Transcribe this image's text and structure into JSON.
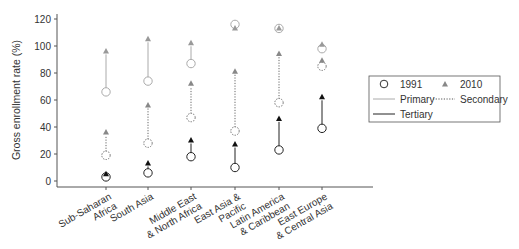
{
  "chart_data": {
    "type": "scatter",
    "title": "",
    "xlabel": "",
    "ylabel": "Gross enrollment rate (%)",
    "ylim": [
      0,
      120
    ],
    "yticks": [
      0,
      20,
      40,
      60,
      80,
      100,
      120
    ],
    "grid": false,
    "legend_position": "right",
    "categories": [
      [
        "Sub-Saharan",
        "Africa"
      ],
      [
        "South Asia"
      ],
      [
        "Middle East",
        "& North Africa"
      ],
      [
        "East Asia &",
        "Pacific"
      ],
      [
        "Latin America",
        "& Caribbean"
      ],
      [
        "East Europe",
        "& Central Asia"
      ]
    ],
    "series": [
      {
        "name": "Primary",
        "style": "solid-light",
        "color": "#aaaaaa",
        "values_1991": [
          66,
          74,
          87,
          116,
          113,
          98
        ],
        "values_2010": [
          96,
          105,
          102,
          113,
          113,
          101
        ]
      },
      {
        "name": "Secondary",
        "style": "dotted",
        "color": "#666666",
        "values_1991": [
          19,
          28,
          47,
          37,
          58,
          85
        ],
        "values_2010": [
          36,
          56,
          72,
          81,
          94,
          89
        ]
      },
      {
        "name": "Tertiary",
        "style": "solid-dark",
        "color": "#222222",
        "values_1991": [
          3,
          6,
          18,
          10,
          23,
          39
        ],
        "values_2010": [
          5,
          13,
          30,
          27,
          46,
          62
        ]
      }
    ],
    "markers": {
      "1991": "open-circle",
      "2010": "filled-triangle"
    }
  },
  "legend": {
    "year1": "1991",
    "year2": "2010",
    "primary": "Primary",
    "secondary": "Secondary",
    "tertiary": "Tertiary"
  },
  "axis": {
    "ylabel": "Gross enrollment rate (%)",
    "yticks": [
      "0",
      "20",
      "40",
      "60",
      "80",
      "100",
      "120"
    ]
  }
}
